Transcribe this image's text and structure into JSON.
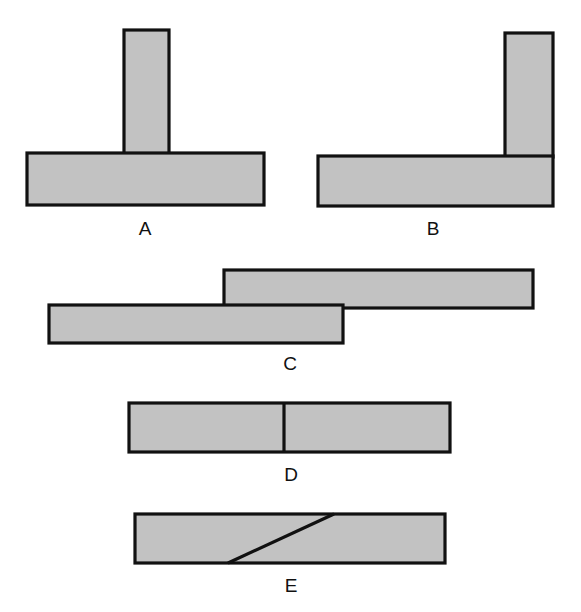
{
  "figure": {
    "fill_color": "#c2c2c2",
    "stroke_color": "#111111",
    "joints": [
      {
        "id": "A",
        "label": "A",
        "shape": "T-joint (post butted onto center of base board)"
      },
      {
        "id": "B",
        "label": "B",
        "shape": "L-joint / corner butt joint (post at right end of base board)"
      },
      {
        "id": "C",
        "label": "C",
        "shape": "Lap joint (two boards overlapping)"
      },
      {
        "id": "D",
        "label": "D",
        "shape": "Straight butt joint (vertical seam)"
      },
      {
        "id": "E",
        "label": "E",
        "shape": "Scarf joint (diagonal seam)"
      }
    ]
  }
}
